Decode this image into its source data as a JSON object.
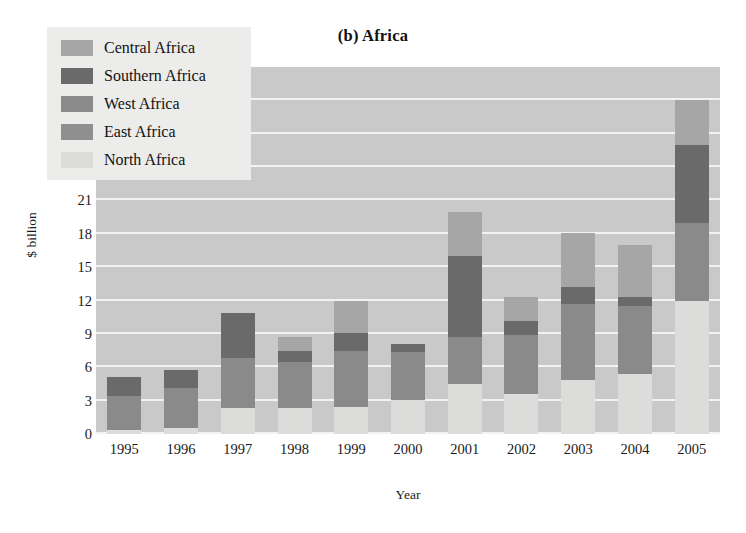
{
  "chart_data": {
    "type": "bar",
    "subtype": "stacked",
    "title": "(b) Africa",
    "xlabel": "Year",
    "ylabel": "$ billion",
    "categories": [
      "1995",
      "1996",
      "1997",
      "1998",
      "1999",
      "2000",
      "2001",
      "2002",
      "2003",
      "2004",
      "2005"
    ],
    "ylim": [
      0,
      33
    ],
    "yticks": [
      0,
      3,
      6,
      9,
      12,
      15,
      18,
      21,
      24,
      27,
      30,
      33
    ],
    "grid": true,
    "legend_position": "upper-left-inside",
    "stack_order_bottom_to_top": [
      "North Africa",
      "East Africa",
      "West Africa",
      "Southern Africa",
      "Central Africa"
    ],
    "series": [
      {
        "name": "North Africa",
        "color": "#dcdcda",
        "values": [
          0.4,
          0.5,
          2.3,
          2.3,
          2.4,
          3.1,
          4.5,
          3.6,
          4.9,
          5.4,
          12.0
        ]
      },
      {
        "name": "East Africa",
        "color": "#8f8f8f",
        "values": [
          0.0,
          0.0,
          0.0,
          0.0,
          0.0,
          0.0,
          0.0,
          0.0,
          0.0,
          0.0,
          0.0
        ]
      },
      {
        "name": "West Africa",
        "color": "#8a8a8a",
        "values": [
          3.0,
          3.6,
          4.5,
          4.2,
          5.1,
          4.3,
          4.2,
          5.3,
          6.8,
          6.1,
          7.0
        ]
      },
      {
        "name": "Southern Africa",
        "color": "#6a6a6a",
        "values": [
          1.7,
          1.7,
          4.1,
          1.0,
          1.6,
          0.7,
          7.3,
          1.3,
          1.5,
          0.8,
          7.0
        ]
      },
      {
        "name": "Central Africa",
        "color": "#a6a6a6",
        "values": [
          0.0,
          0.0,
          0.0,
          1.2,
          2.9,
          0.0,
          4.0,
          2.1,
          4.9,
          4.7,
          4.0
        ]
      }
    ],
    "totals": [
      5.1,
      5.8,
      10.9,
      8.7,
      12.0,
      8.1,
      20.0,
      12.3,
      18.1,
      17.0,
      30.0
    ],
    "plot_background_color": "#c9c9c9",
    "gridline_color": "#f2f2f2",
    "legend_background_color": "#ececeb"
  },
  "legend": {
    "items": [
      {
        "label": "Central Africa",
        "color": "#a6a6a6"
      },
      {
        "label": "Southern Africa",
        "color": "#6a6a6a"
      },
      {
        "label": "West Africa",
        "color": "#8a8a8a"
      },
      {
        "label": "East Africa",
        "color": "#8f8f8f"
      },
      {
        "label": "North Africa",
        "color": "#dcdcda"
      }
    ]
  }
}
